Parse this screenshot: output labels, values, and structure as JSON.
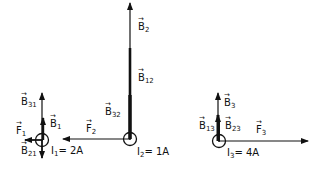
{
  "diagram": {
    "wires": [
      {
        "id": "1",
        "current_label": "I",
        "current_sub": "1",
        "current_value": "= 2A"
      },
      {
        "id": "2",
        "current_label": "I",
        "current_sub": "2",
        "current_value": "= 1A"
      },
      {
        "id": "3",
        "current_label": "I",
        "current_sub": "3",
        "current_value": "= 4A"
      }
    ],
    "labels": {
      "B31": {
        "base": "B",
        "sub": "31"
      },
      "B1": {
        "base": "B",
        "sub": "1"
      },
      "F1": {
        "base": "F",
        "sub": "1"
      },
      "B21": {
        "base": "B",
        "sub": "21"
      },
      "F2": {
        "base": "F",
        "sub": "2"
      },
      "B2": {
        "base": "B",
        "sub": "2"
      },
      "B12": {
        "base": "B",
        "sub": "12"
      },
      "B32": {
        "base": "B",
        "sub": "32"
      },
      "B3": {
        "base": "B",
        "sub": "3"
      },
      "B13": {
        "base": "B",
        "sub": "13"
      },
      "B23": {
        "base": "B",
        "sub": "23"
      },
      "F3": {
        "base": "F",
        "sub": "3"
      }
    },
    "color": "#111111"
  }
}
